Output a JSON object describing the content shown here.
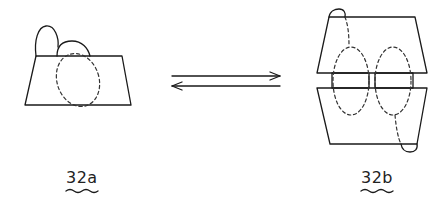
{
  "figures": [
    {
      "id": "32a",
      "label": "32a",
      "description": "trapezoid block with two arches on top and one dashed loop"
    },
    {
      "id": "32b",
      "label": "32b",
      "description": "two trapezoid blocks joined by two bars, with two dashed loops and end arches"
    }
  ],
  "relation": {
    "type": "equilibrium-arrows",
    "forward": "32a to 32b",
    "reverse": "32b to 32a"
  },
  "colors": {
    "stroke": "#1a1a1a",
    "background": "#ffffff"
  }
}
